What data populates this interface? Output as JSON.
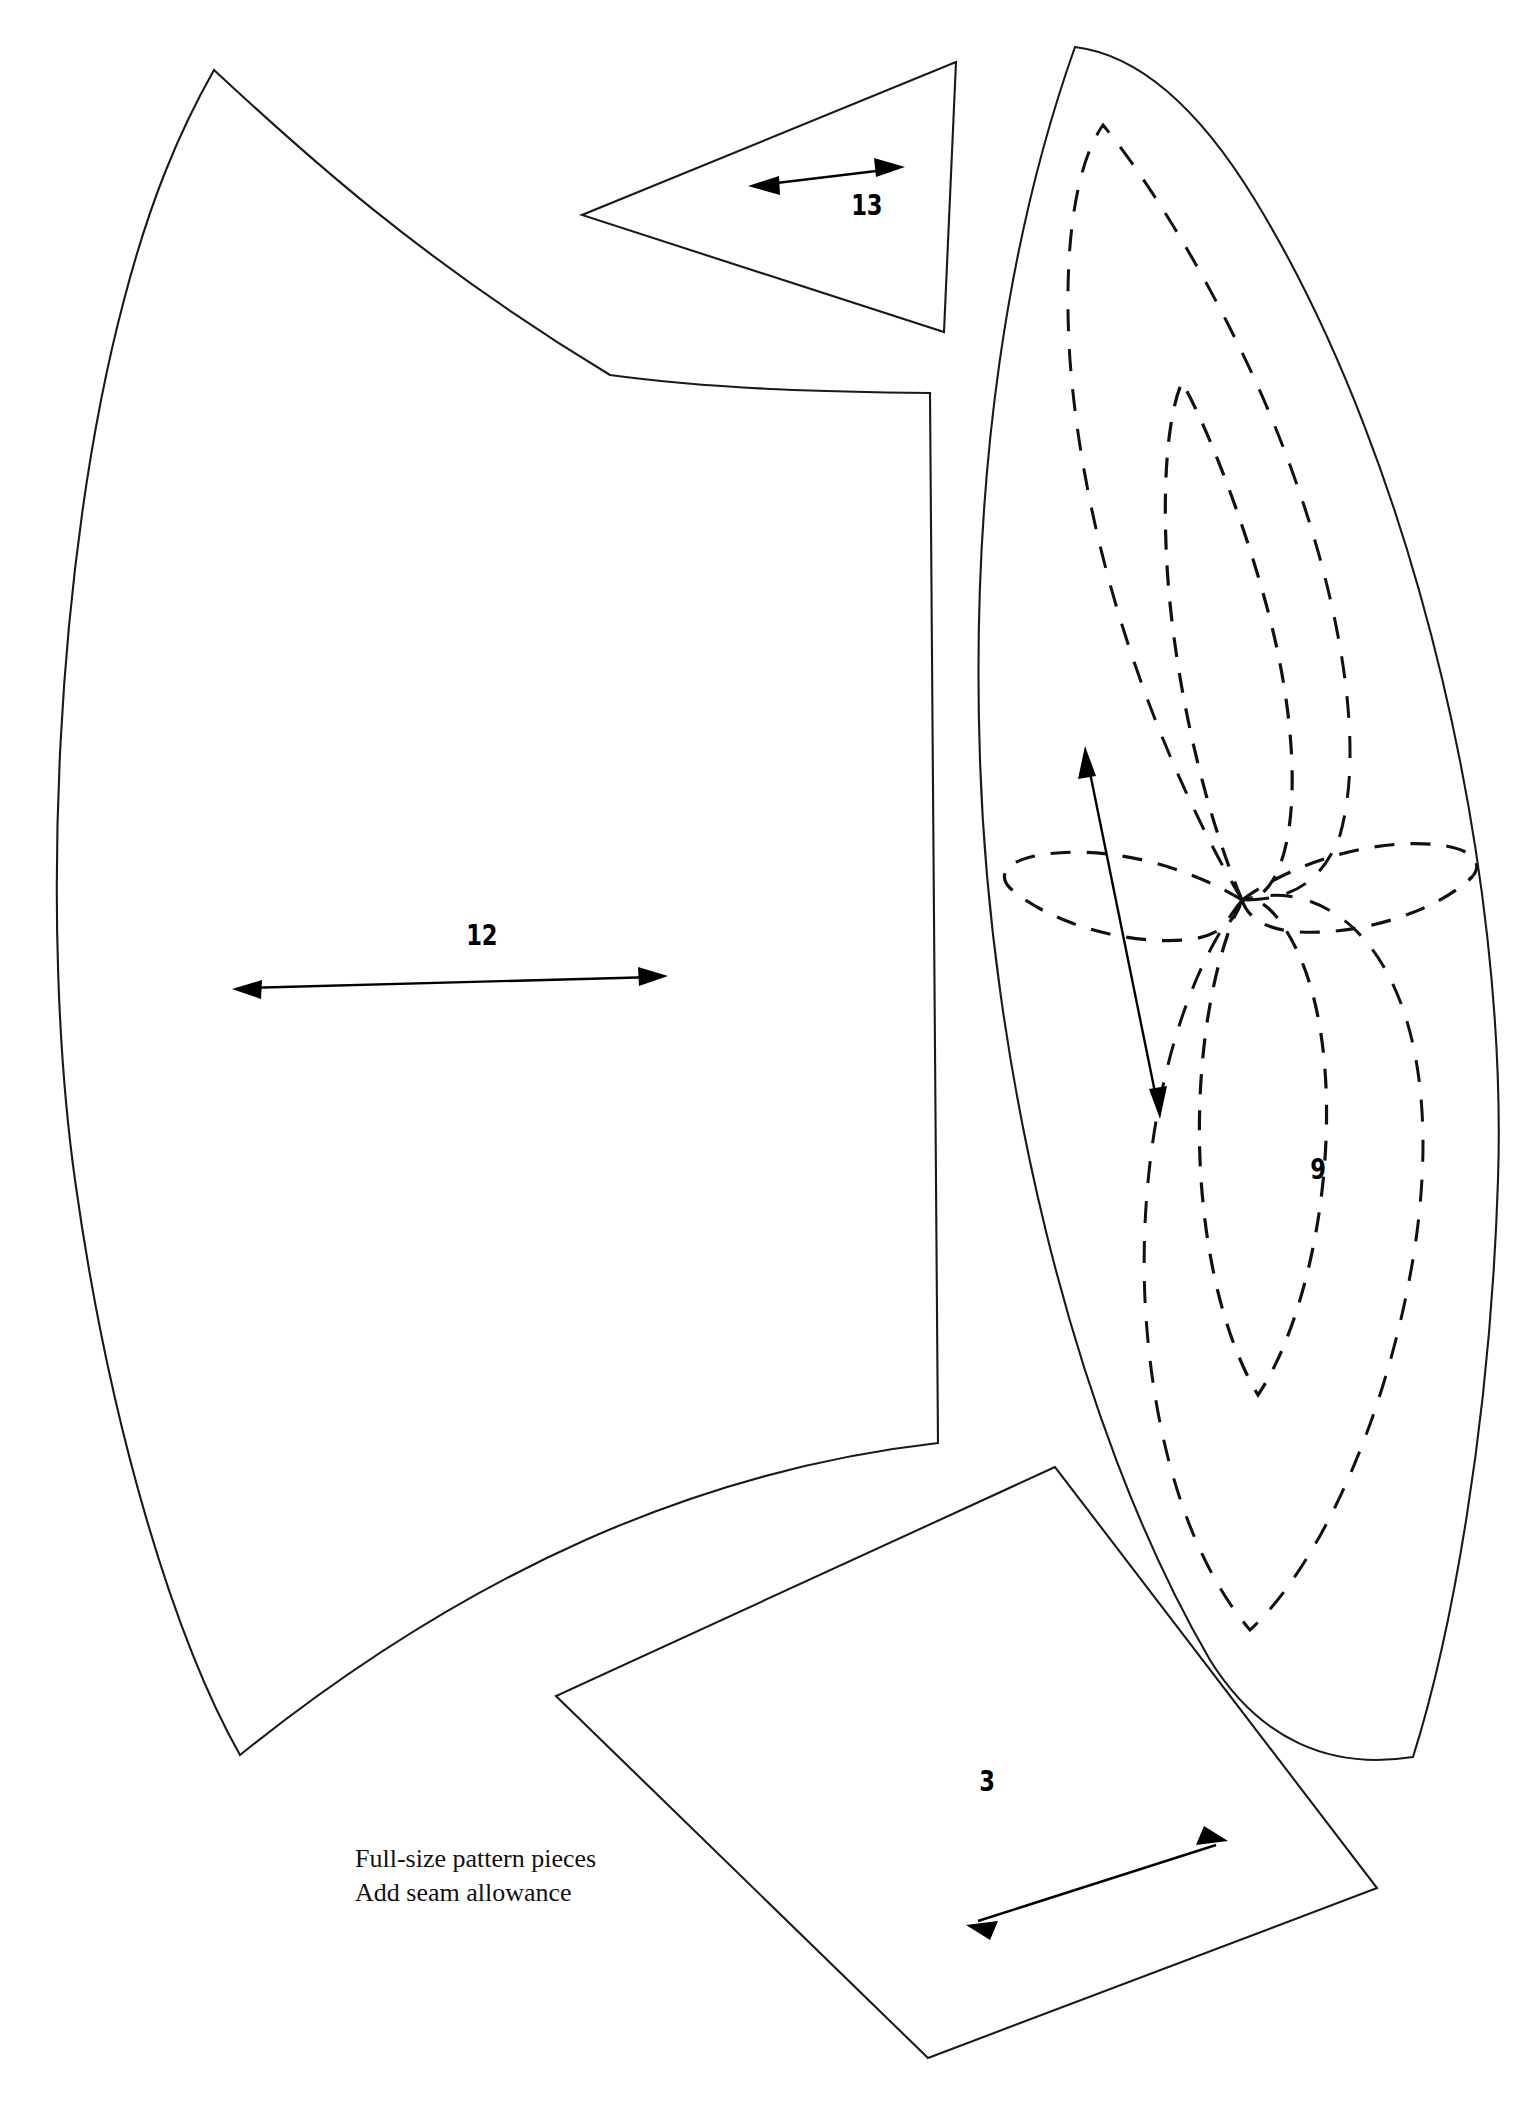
{
  "document": {
    "title": "Full-size pattern pieces",
    "background_color": "#ffffff",
    "ink_color": "#111111",
    "width": 1538,
    "height": 2107
  },
  "caption": {
    "line1": "Full-size pattern pieces",
    "line2": "Add seam allowance"
  },
  "pieces": [
    {
      "id": "piece-12",
      "label": "12",
      "description": "large curved crescent gore panel, left side of sheet",
      "grainline": "double-headed horizontal arrow",
      "label_x": 462,
      "label_y": 938,
      "arrow_from_x": 232,
      "arrow_from_y": 989,
      "arrow_to_x": 668,
      "arrow_to_y": 976
    },
    {
      "id": "piece-13",
      "label": "13",
      "description": "small narrow triangular gusset, top centre",
      "grainline": "double-headed arrow tilted up to the right",
      "label_x": 847,
      "label_y": 208,
      "arrow_from_x": 748,
      "arrow_from_y": 186,
      "arrow_to_x": 905,
      "arrow_to_y": 167
    },
    {
      "id": "piece-9",
      "label": "9",
      "description": "tall pointed lens shaped panel with dashed embroidery flower motif, right side",
      "grainline": "double-headed arrow angled down to the right",
      "label_x": 1308,
      "label_y": 1172,
      "arrow_from_x": 1085,
      "arrow_from_y": 746,
      "arrow_to_x": 1160,
      "arrow_to_y": 1119
    },
    {
      "id": "piece-3",
      "label": "3",
      "description": "tilted quadrilateral panel, bottom centre",
      "grainline": "double-headed arrow angled up to the right",
      "label_x": 977,
      "label_y": 1784,
      "arrow_from_x": 966,
      "arrow_from_y": 1925,
      "arrow_to_x": 1228,
      "arrow_to_y": 1841
    }
  ],
  "motif": {
    "name": "dashed six-petal flower embroidery placement",
    "piece": "9",
    "center_x": 1242,
    "center_y": 900,
    "petal_count": 6,
    "line_style": "dashed"
  }
}
